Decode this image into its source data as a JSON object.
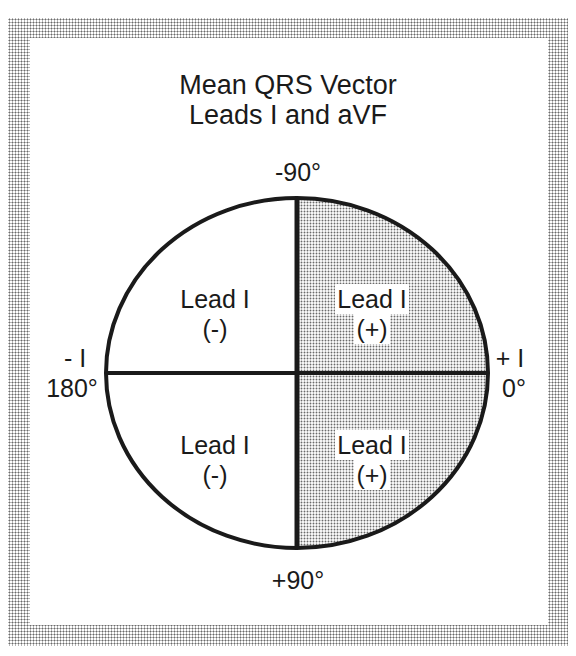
{
  "title": {
    "line1": "Mean QRS Vector",
    "line2": "Leads  I and aVF"
  },
  "axis_labels": {
    "top": "-90°",
    "bottom": "+90°",
    "left_lead": "- I",
    "left_angle": "180°",
    "right_lead": "+ I",
    "right_angle": "0°"
  },
  "quadrants": [
    {
      "position": "upper-left",
      "lead": "Lead  I",
      "sign": "(-)",
      "shaded": false
    },
    {
      "position": "upper-right",
      "lead": "Lead  I",
      "sign": "(+)",
      "shaded": true
    },
    {
      "position": "lower-left",
      "lead": "Lead  I",
      "sign": "(-)",
      "shaded": false
    },
    {
      "position": "lower-right",
      "lead": "Lead  I",
      "sign": "(+)",
      "shaded": true
    }
  ],
  "colors": {
    "line": "#1a1a1a",
    "shade_dot": "#6a6a6a",
    "background": "#ffffff"
  }
}
